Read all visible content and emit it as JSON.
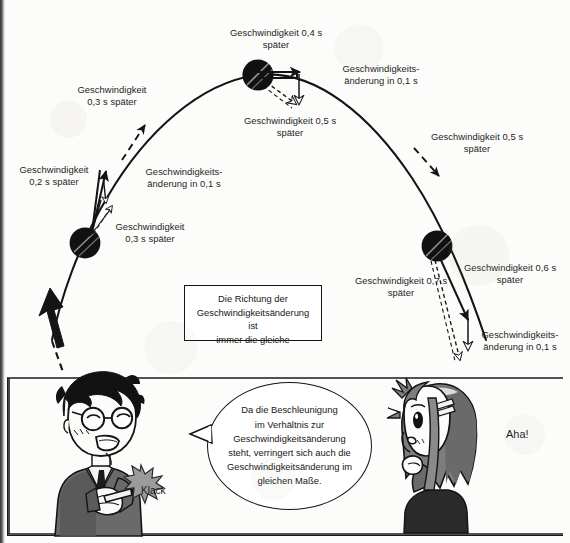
{
  "figure": {
    "kind": "projectile-motion-vector-diagram",
    "language": "de",
    "labels": [
      {
        "id": "v-02",
        "text": "Geschwindigkeit\n0,2 s später"
      },
      {
        "id": "v-03-upper",
        "text": "Geschwindigkeit\n0,3 s später"
      },
      {
        "id": "v-03-lower",
        "text": "Geschwindigkeit\n0,3 s später"
      },
      {
        "id": "dv-left",
        "text": "Geschwindigkeits-\nänderung in 0,1 s"
      },
      {
        "id": "v-04",
        "text": "Geschwindigkeit 0,4 s\nspäter"
      },
      {
        "id": "dv-apex",
        "text": "Geschwindigkeits-\nänderung in 0,1 s"
      },
      {
        "id": "v-05-apex",
        "text": "Geschwindigkeit 0,5 s\nspäter"
      },
      {
        "id": "v-05-right",
        "text": "Geschwindigkeit 0,5 s\nspäter"
      },
      {
        "id": "v-06",
        "text": "Geschwindigkeit 0,6 s\nspäter"
      },
      {
        "id": "v-07",
        "text": "Geschwindigkeit 0,7 s\nspäter"
      },
      {
        "id": "dv-right",
        "text": "Geschwindigkeits-\nänderung in 0,1 s"
      }
    ],
    "note_box": "Die Richtung der\nGeschwindigkeitsänderung ist\nimmer die gleiche",
    "speech_bubble": "Da die Beschleunigung\nim Verhältnis zur\nGeschwindigkeitsänderung\nsteht, verringert sich auch die\nGeschwindigkeitsänderung im\ngleichen Maße.",
    "sound_effect": "Klack",
    "exclamation": "Aha!",
    "characters": [
      {
        "id": "teacher",
        "description": "man-with-glasses-pointing"
      },
      {
        "id": "student",
        "description": "girl-with-hairpin-thinking"
      }
    ],
    "colors": {
      "ink": "#141414",
      "paper": "#fcfcfa",
      "sfx_star": "#9c9c9c",
      "hair_gray": "#6e6e6e"
    }
  }
}
